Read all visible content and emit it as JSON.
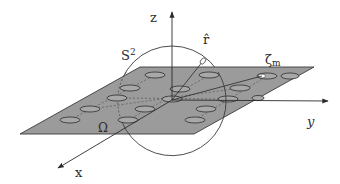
{
  "figure": {
    "type": "3d-coordinate-diagram",
    "colors": {
      "background": "#ffffff",
      "plane_fill": "#9b9b9b",
      "plane_edge": "#3a3a3a",
      "lines": "#2a2a2a",
      "ellipse_fill": "#a8a8a8",
      "marker_fill": "#ffffff"
    }
  },
  "labels": {
    "z_axis": "z",
    "y_axis": "y",
    "x_axis": "x",
    "sphere": "S",
    "sphere_superscript": "2",
    "unit_vector": "r̂",
    "plane": "Ω",
    "marked_point": "ζ",
    "marked_point_subscript": "m"
  },
  "axes": [
    {
      "name": "z",
      "direction": "up"
    },
    {
      "name": "y",
      "direction": "right"
    },
    {
      "name": "x",
      "direction": "down-left"
    }
  ],
  "elements": {
    "sphere": {
      "label": "S²",
      "shape": "circle"
    },
    "plane": {
      "label": "Ω",
      "shading": "gray"
    },
    "unit_vector": {
      "label": "r̂"
    },
    "marked_ellipse": {
      "label": "ζm"
    },
    "ellipse_count": 17
  }
}
